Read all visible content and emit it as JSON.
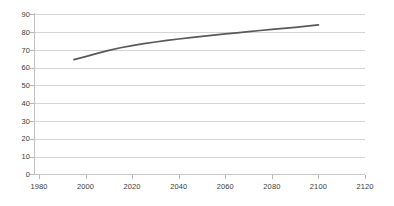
{
  "chart_data": {
    "type": "line",
    "title": "",
    "subtitle": "",
    "xlabel": "",
    "ylabel": "",
    "xlim": [
      1980,
      2120
    ],
    "ylim": [
      0,
      90
    ],
    "grid": "horizontal",
    "legend": "none",
    "x_ticks": [
      1980,
      2000,
      2020,
      2040,
      2060,
      2080,
      2100,
      2120
    ],
    "y_ticks": [
      0,
      10,
      20,
      30,
      40,
      50,
      60,
      70,
      80,
      90
    ],
    "series": [
      {
        "name": "series-1",
        "color": "#595959",
        "x": [
          1995,
          2000,
          2005,
          2010,
          2015,
          2020,
          2025,
          2030,
          2035,
          2040,
          2045,
          2050,
          2055,
          2060,
          2065,
          2070,
          2075,
          2080,
          2085,
          2090,
          2095,
          2100
        ],
        "values": [
          64.5,
          66.2,
          68.0,
          69.7,
          71.2,
          72.4,
          73.5,
          74.4,
          75.3,
          76.1,
          76.9,
          77.6,
          78.3,
          79.0,
          79.6,
          80.3,
          80.9,
          81.5,
          82.1,
          82.7,
          83.3,
          84.0
        ]
      }
    ]
  },
  "axes": {
    "y_tick_labels": [
      "90",
      "80",
      "70",
      "60",
      "50",
      "40",
      "30",
      "20",
      "10",
      "0"
    ],
    "x_tick_labels": [
      "1980",
      "2000",
      "2020",
      "2040",
      "2060",
      "2080",
      "2100",
      "2120"
    ]
  },
  "style": {
    "line_color": "#595959",
    "gridline_color": "#d4d4d4",
    "axis_color": "#c0c0c0",
    "tick_label_color": "#3a3a3a",
    "background": "#ffffff"
  }
}
